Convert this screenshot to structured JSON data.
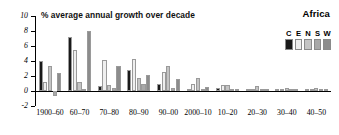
{
  "chart_data": {
    "type": "bar",
    "title": "Africa",
    "subtitle": "% average annual growth over decade",
    "xlabel": "",
    "ylabel": "",
    "ylim": [
      -2,
      10
    ],
    "yticks": [
      -2,
      0,
      2,
      4,
      6,
      8,
      10
    ],
    "ytick_labels": [
      "-2",
      "0",
      "2",
      "4",
      "6",
      "8",
      "10"
    ],
    "grid": false,
    "legend_position": "top-right",
    "categories": [
      "1900–60",
      "60–70",
      "70–80",
      "80–90",
      "90–00",
      "2000–10",
      "10–20",
      "20–30",
      "30–40",
      "40–50"
    ],
    "series": [
      {
        "name": "C",
        "color": "#1a1a1a",
        "values": [
          4.0,
          7.15,
          0.65,
          2.85,
          0.9,
          0.3,
          0.35,
          0.1,
          0.1,
          0.05
        ]
      },
      {
        "name": "E",
        "color": "#efefef",
        "values": [
          1.2,
          5.45,
          4.1,
          4.3,
          2.6,
          0.95,
          0.75,
          0.2,
          0.1,
          0.1
        ]
      },
      {
        "name": "N",
        "color": "#c4c4c4",
        "values": [
          3.4,
          1.2,
          0.85,
          1.75,
          3.4,
          1.8,
          0.85,
          0.65,
          0.45,
          0.45
        ]
      },
      {
        "name": "S",
        "color": "#a8a8a8",
        "values": [
          -0.7,
          0.0,
          0.45,
          1.0,
          0.35,
          0.1,
          0.05,
          0.1,
          0.15,
          0.1
        ]
      },
      {
        "name": "W",
        "color": "#8c8c8c",
        "values": [
          2.45,
          8.05,
          3.3,
          2.2,
          1.65,
          0.55,
          0.25,
          0.2,
          0.15,
          0.05
        ]
      }
    ]
  }
}
